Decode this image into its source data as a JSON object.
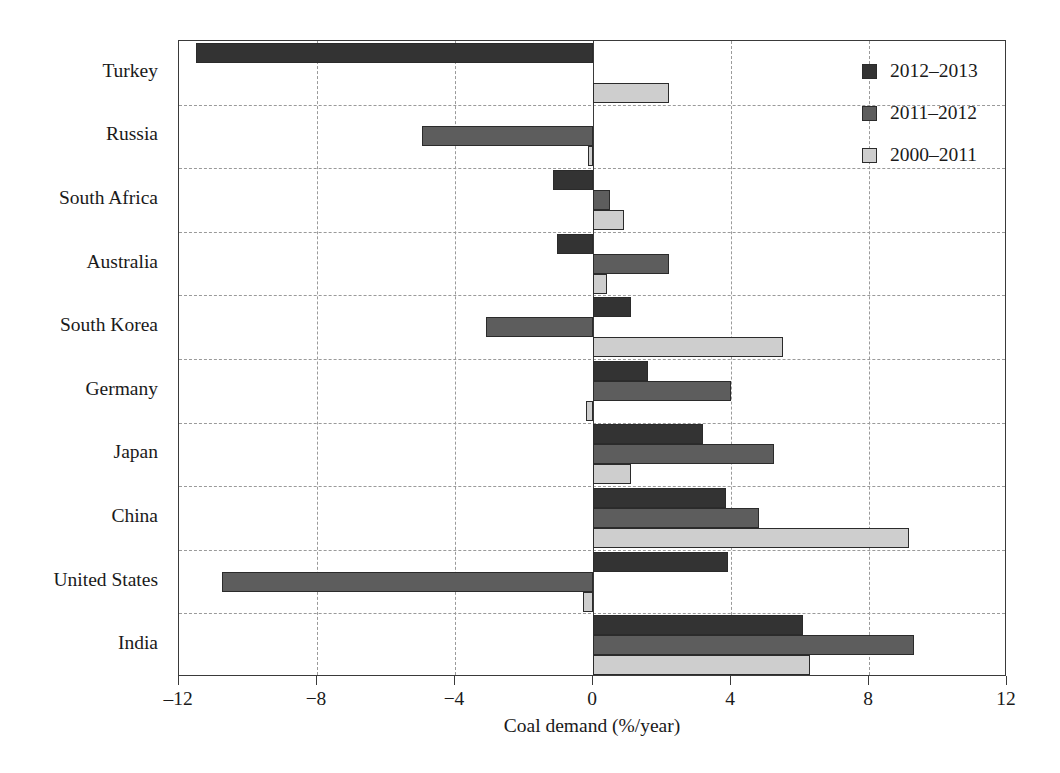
{
  "chart_data": {
    "type": "bar",
    "orientation": "horizontal",
    "title": "",
    "xlabel": "Coal demand (%/year)",
    "ylabel": "",
    "xlim": [
      -12,
      12
    ],
    "xticks": [
      -12,
      -8,
      -4,
      0,
      4,
      8,
      12
    ],
    "xticklabels": [
      "‒12",
      "−8",
      "−4",
      "0",
      "4",
      "8",
      "12"
    ],
    "grid": true,
    "grid_axis": "both",
    "legend_position": "top-right",
    "categories": [
      "Turkey",
      "Russia",
      "South Africa",
      "Australia",
      "South Korea",
      "Germany",
      "Japan",
      "China",
      "United States",
      "India"
    ],
    "series": [
      {
        "name": "2012–2013",
        "color": "#333333",
        "values": [
          -11.5,
          0.0,
          -1.15,
          -1.05,
          1.1,
          1.6,
          3.2,
          3.85,
          3.9,
          6.1
        ]
      },
      {
        "name": "2011–2012",
        "color": "#5d5d5d",
        "values": [
          0.0,
          -4.95,
          0.5,
          2.2,
          -3.1,
          4.0,
          5.25,
          4.8,
          -10.75,
          9.3
        ]
      },
      {
        "name": "2000–2011",
        "color": "#cecece",
        "values": [
          2.2,
          -0.15,
          0.9,
          0.4,
          5.5,
          -0.2,
          1.1,
          9.15,
          -0.3,
          6.3
        ]
      }
    ]
  },
  "legend": {
    "entries": [
      {
        "label": "2012–2013",
        "color": "#333333"
      },
      {
        "label": "2011–2012",
        "color": "#5d5d5d"
      },
      {
        "label": "2000–2011",
        "color": "#cecece"
      }
    ]
  },
  "axis": {
    "x_title": "Coal demand (%/year)"
  },
  "colors": {
    "series_dark": "#333333",
    "series_medium": "#5d5d5d",
    "series_light": "#cecece",
    "axis": "#3a3a3a",
    "grid": "#9a9a9a",
    "background": "#ffffff"
  }
}
